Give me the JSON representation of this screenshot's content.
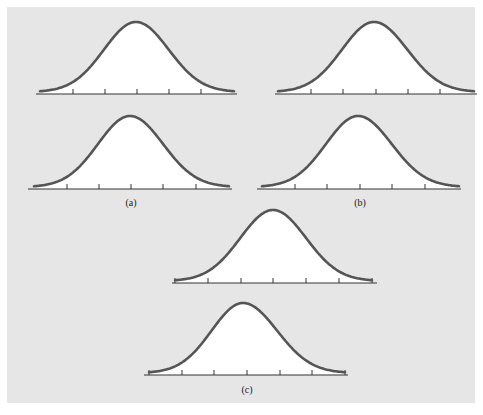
{
  "figure": {
    "background_color": "#e6e6e6",
    "curve_color": "#555555",
    "fill_color": "#ffffff",
    "axis_color": "#333333"
  },
  "groups": [
    {
      "label": "(a)",
      "label_pos": [
        131,
        206
      ],
      "curves": [
        {
          "axis": [
            36,
            237,
            94
          ],
          "curve_x": [
            40,
            234
          ],
          "peak": [
            136,
            22
          ],
          "ticks": [
            73,
            105,
            137,
            169,
            201
          ],
          "end_ticks": false
        },
        {
          "axis": [
            28,
            232,
            189
          ],
          "curve_x": [
            34,
            229
          ],
          "peak": [
            130,
            116
          ],
          "ticks": [
            67,
            99,
            131,
            163,
            196
          ],
          "end_ticks": false
        }
      ]
    },
    {
      "label": "(b)",
      "label_pos": [
        360,
        206
      ],
      "curves": [
        {
          "axis": [
            275,
            477,
            94
          ],
          "curve_x": [
            278,
            474
          ],
          "peak": [
            374,
            22
          ],
          "ticks": [
            311,
            343,
            376,
            408,
            440
          ],
          "end_ticks": false
        },
        {
          "axis": [
            257,
            461,
            189
          ],
          "curve_x": [
            262,
            459
          ],
          "peak": [
            358,
            116
          ],
          "ticks": [
            295,
            327,
            360,
            392,
            425
          ],
          "end_ticks": false
        }
      ]
    },
    {
      "label": "(c)",
      "label_pos": [
        247,
        393
      ],
      "curves": [
        {
          "axis": [
            172,
            377,
            283
          ],
          "curve_x": [
            175,
            372
          ],
          "peak": [
            273,
            210
          ],
          "ticks": [
            208,
            241,
            273,
            306,
            339
          ],
          "end_ticks": true
        },
        {
          "axis": [
            144,
            348,
            375
          ],
          "curve_x": [
            149,
            345
          ],
          "peak": [
            243,
            303
          ],
          "ticks": [
            182,
            214,
            247,
            280,
            312
          ],
          "end_ticks": true
        }
      ]
    }
  ]
}
